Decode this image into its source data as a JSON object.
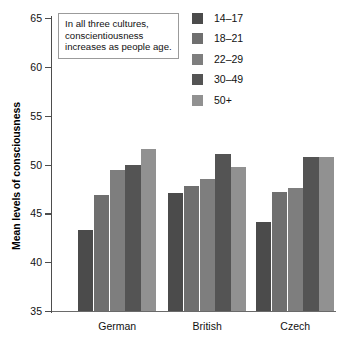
{
  "chart_data": {
    "type": "bar",
    "title": "",
    "subtitle": "",
    "xlabel": "",
    "ylabel": "Mean levels of consciousness",
    "categories": [
      "German",
      "British",
      "Czech"
    ],
    "series": [
      {
        "name": "14–17",
        "color": "#4b4b4b",
        "values": [
          43.3,
          47.1,
          44.1
        ]
      },
      {
        "name": "18–21",
        "color": "#6f6f6f",
        "values": [
          46.9,
          47.8,
          47.2
        ]
      },
      {
        "name": "22–29",
        "color": "#7e7e7e",
        "values": [
          49.4,
          48.5,
          47.6
        ]
      },
      {
        "name": "30–49",
        "color": "#545454",
        "values": [
          50.0,
          51.1,
          50.8
        ]
      },
      {
        "name": "50+",
        "color": "#919191",
        "values": [
          51.6,
          49.7,
          50.8
        ]
      }
    ],
    "ylim": [
      35,
      65
    ],
    "yticks": [
      35,
      40,
      45,
      50,
      55,
      60,
      65
    ],
    "ytick_labels": [
      "35",
      "40",
      "45",
      "50",
      "55",
      "60",
      "65"
    ],
    "grid": false,
    "legend_position": "top-right",
    "annotations": [
      {
        "name": "insight-note",
        "text": "In all three cultures, conscientiousness increases as people age."
      }
    ]
  },
  "legend": {
    "items": [
      {
        "label": "14–17",
        "color": "#4b4b4b"
      },
      {
        "label": "18–21",
        "color": "#6f6f6f"
      },
      {
        "label": "22–29",
        "color": "#7e7e7e"
      },
      {
        "label": "30–49",
        "color": "#545454"
      },
      {
        "label": "50+",
        "color": "#919191"
      }
    ]
  },
  "note": {
    "line1": "In all three cultures,",
    "line2": "conscientiousness",
    "line3": "increases as people age."
  },
  "axis": {
    "y_title": "Mean levels of consciousness"
  }
}
